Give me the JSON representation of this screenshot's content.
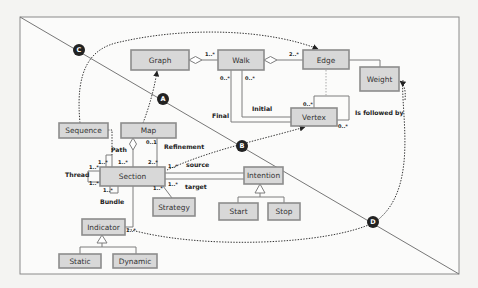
{
  "diagram": {
    "type": "UML class diagram with trajectory overlay",
    "classes": {
      "graph": "Graph",
      "walk": "Walk",
      "edge": "Edge",
      "weight": "Weight",
      "vertex": "Vertex",
      "sequence": "Sequence",
      "map": "Map",
      "section": "Section",
      "strategy": "Strategy",
      "intention": "Intention",
      "start": "Start",
      "stop": "Stop",
      "indicator": "Indicator",
      "static": "Static",
      "dynamic": "Dynamic"
    },
    "relations": {
      "initial": "Initial",
      "final": "Final",
      "is_followed_by": "Is followed by",
      "refinement": "Refinement",
      "source": "source",
      "target": "target",
      "path": "Path",
      "thread": "Thread",
      "bundle": "Bundle"
    },
    "multiplicities": {
      "graph_walk": "1..*",
      "walk_edge": "2..*",
      "walk_final": "0..*",
      "walk_initial": "0..*",
      "vertex_loop_top": "0..*",
      "vertex_loop_bottom": "0..*",
      "map_section": "0..1",
      "section_refinement": "2..*",
      "section_path_left": "1..*",
      "section_path_right": "1..*",
      "section_thread_top": "1..*",
      "section_thread_bottom": "1..*",
      "section_bundle": "1..*",
      "section_source": "1..*",
      "section_target": "1..*",
      "section_strategy": "1..*",
      "indicator_section": "1..*"
    },
    "markers": [
      "A",
      "B",
      "C",
      "D"
    ]
  }
}
